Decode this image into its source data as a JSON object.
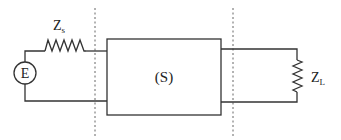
{
  "diagram": {
    "source": {
      "symbol": "E"
    },
    "source_impedance": {
      "main": "Z",
      "sub": "s"
    },
    "system": {
      "label": "(S)"
    },
    "load_impedance": {
      "main": "Z",
      "sub": "L"
    },
    "colors": {
      "line": "#333333",
      "boundary": "#666666",
      "background": "#ffffff"
    }
  }
}
